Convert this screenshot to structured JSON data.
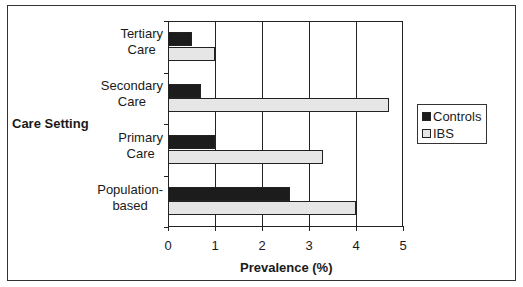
{
  "chart_data": {
    "type": "bar",
    "orientation": "horizontal",
    "title": "",
    "xlabel": "Prevalence (%)",
    "ylabel": "Care Setting",
    "categories": [
      "Tertiary Care",
      "Secondary Care",
      "Primary Care",
      "Population-based"
    ],
    "series": [
      {
        "name": "Controls",
        "color": "#1c1c1c",
        "values": [
          0.5,
          0.7,
          1.0,
          2.6
        ]
      },
      {
        "name": "IBS",
        "color": "#e6e6e6",
        "values": [
          1.0,
          4.7,
          3.3,
          4.0
        ]
      }
    ],
    "xlim": [
      0,
      5
    ],
    "xticks": [
      "0",
      "1",
      "2",
      "3",
      "4",
      "5"
    ],
    "grid": "vertical",
    "legend_position": "right"
  },
  "labels": {
    "cat0_line1": "Tertiary",
    "cat0_line2": "Care",
    "cat1_line1": "Secondary",
    "cat1_line2": "Care",
    "cat2_line1": "Primary",
    "cat2_line2": "Care",
    "cat3_line1": "Population-",
    "cat3_line2": "based"
  }
}
